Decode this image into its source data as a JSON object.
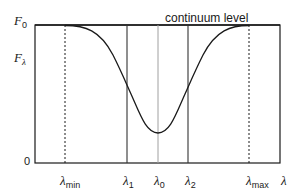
{
  "diagram": {
    "title": "continuum level",
    "y_axis": {
      "top_label": {
        "symbol": "F",
        "sub": "0"
      },
      "mid_label": {
        "symbol": "F",
        "sub": "λ"
      },
      "zero_label": "0"
    },
    "x_axis": {
      "labels": [
        {
          "id": "lambda_min",
          "symbol": "λ",
          "sub": "min",
          "line": "dotted"
        },
        {
          "id": "lambda_1",
          "symbol": "λ",
          "sub": "1",
          "line": "solid"
        },
        {
          "id": "lambda_0",
          "symbol": "λ",
          "sub": "0",
          "line": "gray"
        },
        {
          "id": "lambda_2",
          "symbol": "λ",
          "sub": "2",
          "line": "solid"
        },
        {
          "id": "lambda_max",
          "symbol": "λ",
          "sub": "max",
          "line": "dotted"
        }
      ],
      "axis_label": "λ"
    },
    "curve": "absorption line profile: flux drops from continuum F0 to a minimum at λ0",
    "colors": {
      "stroke": "#1a1a1a",
      "center_line": "#a0a0a0",
      "background": "#ffffff"
    }
  }
}
